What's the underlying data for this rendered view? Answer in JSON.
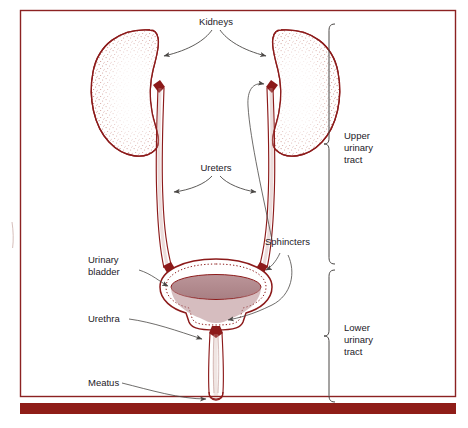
{
  "figure": {
    "labels": {
      "kidneys": "Kidneys",
      "ureters": "Ureters",
      "sphincters": "Sphincters",
      "urinary_bladder_line1": "Urinary",
      "urinary_bladder_line2": "bladder",
      "urethra": "Urethra",
      "meatus": "Meatus",
      "upper_tract_line1": "Upper",
      "upper_tract_line2": "urinary",
      "upper_tract_line3": "tract",
      "lower_tract_line1": "Lower",
      "lower_tract_line2": "urinary",
      "lower_tract_line3": "tract"
    },
    "colors": {
      "organ_outline": "#8c1a1a",
      "frame_border": "#8c2222",
      "bottom_bar": "#8f1d18",
      "urine_fill": "#b08a8e",
      "leader_line": "#4a4745",
      "stipple": "#a8524a",
      "background": "#ffffff",
      "text": "#23201f"
    }
  }
}
